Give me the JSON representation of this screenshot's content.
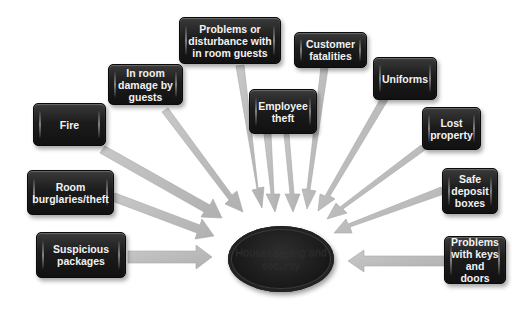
{
  "diagram": {
    "type": "hub-and-spoke",
    "center": {
      "label": "Housekeeping and security"
    },
    "nodes": [
      {
        "id": "suspicious-packages",
        "label": "Suspicious packages"
      },
      {
        "id": "room-burglaries",
        "label": "Room burglaries/theft"
      },
      {
        "id": "fire",
        "label": "Fire"
      },
      {
        "id": "in-room-damage",
        "label": "In room damage by guests"
      },
      {
        "id": "problems-disturbance",
        "label": "Problems or disturbance with in room guests"
      },
      {
        "id": "employee-theft",
        "label": "Employee theft"
      },
      {
        "id": "customer-fatalities",
        "label": "Customer fatalities"
      },
      {
        "id": "uniforms",
        "label": "Uniforms"
      },
      {
        "id": "lost-property",
        "label": "Lost property"
      },
      {
        "id": "safe-deposit",
        "label": "Safe deposit boxes"
      },
      {
        "id": "keys-doors",
        "label": "Problems with keys and doors"
      }
    ],
    "colors": {
      "box_fill": "#1c1c1c",
      "box_text": "#f2f2f2",
      "arrow_fill": "#bdbdbd",
      "background": "#ffffff"
    }
  }
}
